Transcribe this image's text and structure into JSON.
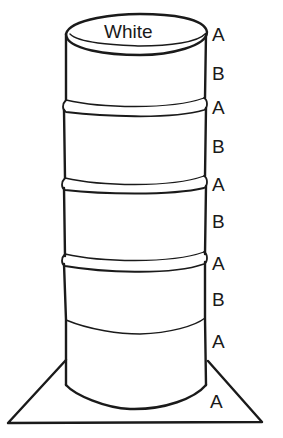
{
  "diagram": {
    "top_label": "White",
    "side_labels": [
      {
        "text": "A",
        "x": 212,
        "y": 41
      },
      {
        "text": "B",
        "x": 212,
        "y": 80
      },
      {
        "text": "A",
        "x": 212,
        "y": 114
      },
      {
        "text": "B",
        "x": 212,
        "y": 153
      },
      {
        "text": "A",
        "x": 212,
        "y": 191
      },
      {
        "text": "B",
        "x": 212,
        "y": 228
      },
      {
        "text": "A",
        "x": 212,
        "y": 270
      },
      {
        "text": "B",
        "x": 212,
        "y": 306
      },
      {
        "text": "A",
        "x": 212,
        "y": 348
      },
      {
        "text": "A",
        "x": 210,
        "y": 408
      }
    ],
    "colors": {
      "stroke": "#1a1a1a",
      "background": "#ffffff"
    }
  }
}
